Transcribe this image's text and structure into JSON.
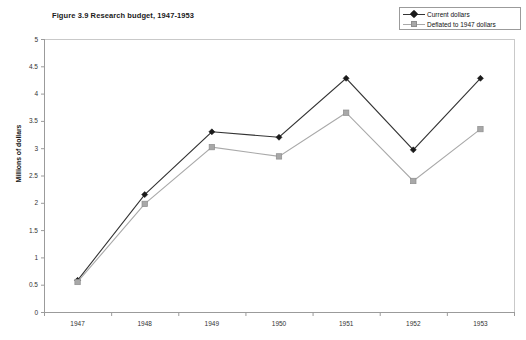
{
  "chart_data": {
    "type": "line",
    "title": "Figure 3.9 Research budget, 1947-1953",
    "xlabel": "",
    "ylabel": "Millions of dollars",
    "categories": [
      "1947",
      "1948",
      "1949",
      "1950",
      "1951",
      "1952",
      "1953"
    ],
    "ylim": [
      0,
      5
    ],
    "ytick_labels": [
      "5",
      "4.5",
      "4",
      "3.5",
      "3",
      "2.5",
      "2",
      "1.5",
      "1",
      "0.5",
      "0"
    ],
    "ytick_values": [
      5,
      4.5,
      4,
      3.5,
      3,
      2.5,
      2,
      1.5,
      1,
      0.5,
      0
    ],
    "grid": false,
    "legend_position": "top-right",
    "series": [
      {
        "name": "Current dollars",
        "marker": "diamond",
        "color": "#333333",
        "marker_color": "#1a1a1a",
        "values": [
          0.58,
          2.15,
          3.3,
          3.2,
          4.28,
          2.97,
          4.28
        ]
      },
      {
        "name": "Deflated to 1947 dollars",
        "marker": "square",
        "color": "#a9a9a9",
        "marker_color": "#a8a8a8",
        "values": [
          0.55,
          1.98,
          3.02,
          2.85,
          3.65,
          2.4,
          3.35
        ]
      }
    ]
  },
  "legend": {
    "items": [
      {
        "label": "Current dollars"
      },
      {
        "label": "Deflated to 1947 dollars"
      }
    ]
  },
  "colors": {
    "axis": "#9b9b9b",
    "series_current": "#333333",
    "series_deflated": "#a9a9a9",
    "text": "#111111"
  }
}
